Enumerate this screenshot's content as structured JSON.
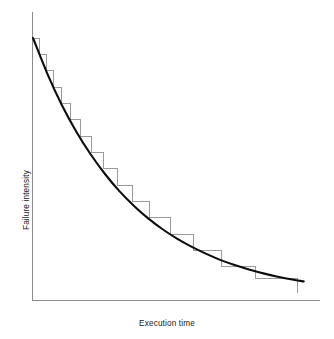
{
  "figure": {
    "width": 334,
    "height": 339,
    "background": "#ffffff"
  },
  "chart_data": {
    "type": "line",
    "title": "",
    "subtitle": "",
    "xlabel": "Execution time",
    "ylabel": "Failure intensity",
    "grid": false,
    "legend": null,
    "axis": {
      "x_ticks": [],
      "y_ticks": [],
      "x_tick_labels": [],
      "y_tick_labels": [],
      "xlim": [
        0,
        1
      ],
      "ylim": [
        0,
        1
      ],
      "arrowheads": false,
      "color": "#8b8b8b"
    },
    "series": [
      {
        "name": "Smooth failure intensity model",
        "kind": "line",
        "style": "solid-thick-black",
        "color": "#0d0d0d",
        "linewidth": 2.1,
        "description": "Exponentially decaying failure intensity curve",
        "x": [
          0.0,
          0.05,
          0.1,
          0.15,
          0.2,
          0.25,
          0.3,
          0.35,
          0.4,
          0.45,
          0.5,
          0.55,
          0.6,
          0.65,
          0.7,
          0.75,
          0.8,
          0.85,
          0.9,
          0.94
        ],
        "y": [
          1.0,
          0.862,
          0.742,
          0.64,
          0.552,
          0.476,
          0.41,
          0.354,
          0.305,
          0.263,
          0.227,
          0.196,
          0.169,
          0.145,
          0.125,
          0.108,
          0.093,
          0.08,
          0.069,
          0.062
        ]
      },
      {
        "name": "Observed per-failure step reduction",
        "kind": "step",
        "style": "thin-gray-staircase",
        "color": "#9a9a9a",
        "linewidth": 1,
        "description": "Staircase: failure intensity drops by a fixed amount after each failure is corrected; interval widths grow as intensity falls",
        "step_count": 16,
        "x_edges": [
          0.0,
          0.022,
          0.046,
          0.072,
          0.1,
          0.131,
          0.165,
          0.203,
          0.245,
          0.292,
          0.345,
          0.406,
          0.476,
          0.558,
          0.655,
          0.772,
          0.917
        ],
        "y_levels": [
          1.0,
          0.937,
          0.874,
          0.811,
          0.748,
          0.685,
          0.622,
          0.559,
          0.496,
          0.433,
          0.37,
          0.307,
          0.244,
          0.181,
          0.118,
          0.072
        ]
      }
    ]
  }
}
